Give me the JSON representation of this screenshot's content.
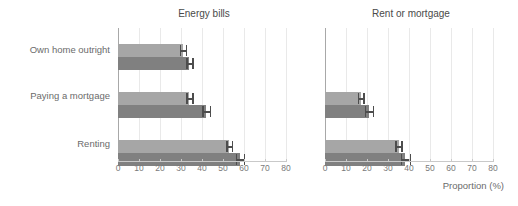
{
  "chart_data": {
    "type": "bar",
    "orientation": "horizontal",
    "title": "",
    "xlabel": "Proportion (%)",
    "ylabel": "",
    "xlim": [
      0,
      80
    ],
    "xticks": [
      0,
      10,
      20,
      30,
      40,
      50,
      60,
      70,
      80
    ],
    "grid": true,
    "legend": "none",
    "categories": [
      "Own home outright",
      "Paying a mortgage",
      "Renting"
    ],
    "colors": {
      "series_light": "#a6a6a6",
      "series_dark": "#808080",
      "error_bar": "#4d4d4d",
      "gridline": "#e9e9e9",
      "axis": "#a8a8a8",
      "text": "#6b6b6b"
    },
    "panels": [
      {
        "title": "Energy bills",
        "series": [
          {
            "name": "series-light",
            "values": [
              31,
              34,
              53
            ],
            "err_low": [
              29.5,
              32.5,
              51.5
            ],
            "err_high": [
              33,
              36,
              55
            ]
          },
          {
            "name": "series-dark",
            "values": [
              34,
              42,
              58
            ],
            "err_low": [
              32.5,
              40,
              56
            ],
            "err_high": [
              36,
              44.5,
              60.5
            ]
          }
        ]
      },
      {
        "title": "Rent or mortgage",
        "series": [
          {
            "name": "series-light",
            "values": [
              null,
              17,
              35
            ],
            "err_low": [
              null,
              15.5,
              33.5
            ],
            "err_high": [
              null,
              19,
              37
            ]
          },
          {
            "name": "series-dark",
            "values": [
              null,
              21,
              38
            ],
            "err_low": [
              null,
              19,
              36
            ],
            "err_high": [
              null,
              23.5,
              41
            ]
          }
        ]
      }
    ]
  },
  "ylabels": {
    "0": "Own home outright",
    "1": "Paying a mortgage",
    "2": "Renting"
  },
  "panel_energy": {
    "title": "Energy bills"
  },
  "panel_rent": {
    "title": "Rent or mortgage"
  },
  "xaxis": {
    "title": "Proportion (%)",
    "ticks": [
      "0",
      "10",
      "20",
      "30",
      "40",
      "50",
      "60",
      "70",
      "80"
    ]
  }
}
